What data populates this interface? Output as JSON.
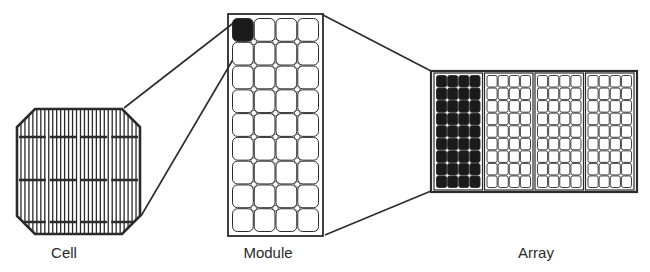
{
  "diagram": {
    "type": "solar-pv-hierarchy",
    "labels": {
      "cell": "Cell",
      "module": "Module",
      "array": "Array"
    },
    "cell": {
      "shape": "pseudo-square octagon",
      "vertical_fingers": 30,
      "horizontal_busbars": 3,
      "busbar_segments": 4
    },
    "module": {
      "columns": 4,
      "rows": 9,
      "highlighted_cell": [
        0,
        0
      ]
    },
    "array": {
      "modules": 4,
      "module_columns": 4,
      "module_rows": 9,
      "highlighted_module": 0
    },
    "colors": {
      "stroke": "#2b2b2b",
      "fill_highlight": "#1a1a1a",
      "background": "#ffffff"
    }
  }
}
